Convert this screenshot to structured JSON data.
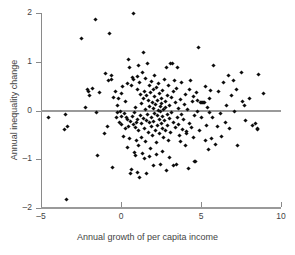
{
  "chart_data": {
    "type": "scatter",
    "title": "",
    "xlabel": "Annual growth of per capita income",
    "ylabel": "Annual inequality change",
    "xlim": [
      -5,
      10
    ],
    "ylim": [
      -2,
      2
    ],
    "xticks": [
      -5,
      0,
      5,
      10
    ],
    "yticks": [
      -2,
      -1,
      0,
      1,
      2
    ],
    "xtick_labels": [
      "-5",
      "0",
      "5",
      "10"
    ],
    "ytick_labels": [
      "-2",
      "-1",
      "0",
      "1",
      "2"
    ],
    "grid": false,
    "legend": null,
    "reference_line": {
      "axis": "horizontal",
      "value": 0,
      "color": "#9a9a9a"
    },
    "marker": {
      "shape": "diamond",
      "size_px": 3,
      "color": "#0d0d0d"
    },
    "n_points": 232,
    "points": [
      [
        -4.55,
        -0.14
      ],
      [
        -3.45,
        -0.09
      ],
      [
        -3.52,
        -0.39
      ],
      [
        -3.35,
        -0.32
      ],
      [
        -3.4,
        -1.83
      ],
      [
        -2.45,
        1.47
      ],
      [
        -2.25,
        0.07
      ],
      [
        -2.1,
        0.44
      ],
      [
        -2.05,
        0.38
      ],
      [
        -1.95,
        0.3
      ],
      [
        -1.8,
        0.46
      ],
      [
        -1.62,
        1.86
      ],
      [
        -1.55,
        -0.05
      ],
      [
        -1.45,
        -0.92
      ],
      [
        -1.35,
        0.37
      ],
      [
        -1.05,
        -0.47
      ],
      [
        -0.95,
        0.75
      ],
      [
        -0.85,
        -0.32
      ],
      [
        -0.8,
        0.62
      ],
      [
        -0.7,
        1.57
      ],
      [
        -0.62,
        0.64
      ],
      [
        -0.58,
        0.71
      ],
      [
        -0.55,
        -1.16
      ],
      [
        -0.45,
        0.27
      ],
      [
        -0.35,
        0.39
      ],
      [
        -0.3,
        -0.14
      ],
      [
        -0.25,
        0.11
      ],
      [
        -0.2,
        -0.05
      ],
      [
        -0.15,
        0.25
      ],
      [
        -0.1,
        -0.24
      ],
      [
        -0.05,
        -0.02
      ],
      [
        0.0,
        -0.12
      ],
      [
        0.02,
        0.35
      ],
      [
        0.05,
        -0.29
      ],
      [
        0.1,
        0.5
      ],
      [
        0.15,
        -0.53
      ],
      [
        0.2,
        -0.06
      ],
      [
        0.25,
        -0.36
      ],
      [
        0.3,
        0.18
      ],
      [
        0.35,
        -0.14
      ],
      [
        0.4,
        0.56
      ],
      [
        0.42,
        -0.18
      ],
      [
        0.45,
        1.04
      ],
      [
        0.48,
        -0.32
      ],
      [
        0.5,
        -0.58
      ],
      [
        0.55,
        0.88
      ],
      [
        0.58,
        -0.22
      ],
      [
        0.6,
        -1.3
      ],
      [
        0.65,
        0.52
      ],
      [
        0.7,
        -0.12
      ],
      [
        0.72,
        0.68
      ],
      [
        0.75,
        0.64
      ],
      [
        0.78,
        -0.28
      ],
      [
        0.8,
        1.98
      ],
      [
        0.82,
        -0.04
      ],
      [
        0.85,
        -0.86
      ],
      [
        0.88,
        -0.92
      ],
      [
        0.9,
        -0.34
      ],
      [
        0.92,
        0.06
      ],
      [
        0.95,
        -0.62
      ],
      [
        0.98,
        -0.25
      ],
      [
        1.0,
        0.7
      ],
      [
        1.02,
        -0.18
      ],
      [
        1.05,
        0.44
      ],
      [
        1.08,
        -0.72
      ],
      [
        1.1,
        0.92
      ],
      [
        1.12,
        -0.42
      ],
      [
        1.15,
        -1.37
      ],
      [
        1.18,
        0.58
      ],
      [
        1.2,
        -0.1
      ],
      [
        1.22,
        0.32
      ],
      [
        1.25,
        -0.55
      ],
      [
        1.28,
        0.14
      ],
      [
        1.3,
        -0.26
      ],
      [
        1.32,
        0.78
      ],
      [
        1.35,
        -0.88
      ],
      [
        1.38,
        0.24
      ],
      [
        1.4,
        1.2
      ],
      [
        1.42,
        -0.16
      ],
      [
        1.45,
        0.4
      ],
      [
        1.48,
        -0.36
      ],
      [
        1.5,
        0.02
      ],
      [
        1.52,
        -0.64
      ],
      [
        1.55,
        0.66
      ],
      [
        1.58,
        -0.2
      ],
      [
        1.6,
        0.3
      ],
      [
        1.62,
        -1.3
      ],
      [
        1.65,
        0.96
      ],
      [
        1.68,
        -0.08
      ],
      [
        1.7,
        0.2
      ],
      [
        1.72,
        -0.46
      ],
      [
        1.75,
        0.52
      ],
      [
        1.78,
        -0.24
      ],
      [
        1.8,
        0.08
      ],
      [
        1.82,
        -0.78
      ],
      [
        1.85,
        0.36
      ],
      [
        1.88,
        -0.14
      ],
      [
        1.9,
        0.6
      ],
      [
        1.92,
        -0.32
      ],
      [
        1.95,
        0.16
      ],
      [
        1.98,
        -0.52
      ],
      [
        2.0,
        0.04
      ],
      [
        2.02,
        0.44
      ],
      [
        2.05,
        -0.22
      ],
      [
        2.08,
        0.72
      ],
      [
        2.1,
        -0.06
      ],
      [
        2.12,
        0.28
      ],
      [
        2.15,
        -0.4
      ],
      [
        2.18,
        0.12
      ],
      [
        2.2,
        -0.66
      ],
      [
        2.22,
        0.48
      ],
      [
        2.25,
        -0.1
      ],
      [
        2.28,
        0.2
      ],
      [
        2.3,
        -0.3
      ],
      [
        2.32,
        0.0
      ],
      [
        2.35,
        0.56
      ],
      [
        2.38,
        -0.18
      ],
      [
        2.4,
        0.34
      ],
      [
        2.42,
        -0.48
      ],
      [
        2.45,
        0.08
      ],
      [
        2.48,
        -0.02
      ],
      [
        2.5,
        0.24
      ],
      [
        2.52,
        -0.26
      ],
      [
        2.55,
        0.14
      ],
      [
        2.58,
        -0.36
      ],
      [
        2.6,
        0.42
      ],
      [
        2.62,
        -0.12
      ],
      [
        2.65,
        0.02
      ],
      [
        2.68,
        -0.56
      ],
      [
        2.7,
        0.64
      ],
      [
        2.72,
        -0.2
      ],
      [
        2.75,
        0.18
      ],
      [
        2.78,
        -0.42
      ],
      [
        2.8,
        0.06
      ],
      [
        2.82,
        -1.23
      ],
      [
        2.85,
        0.88
      ],
      [
        2.88,
        -0.3
      ],
      [
        2.9,
        0.3
      ],
      [
        2.92,
        -0.08
      ],
      [
        2.95,
        0.52
      ],
      [
        2.98,
        -0.62
      ],
      [
        3.0,
        0.1
      ],
      [
        3.05,
        -0.16
      ],
      [
        3.08,
        0.96
      ],
      [
        3.1,
        -0.46
      ],
      [
        3.15,
        0.26
      ],
      [
        3.18,
        -0.04
      ],
      [
        3.2,
        0.96
      ],
      [
        3.25,
        -1.12
      ],
      [
        3.28,
        0.38
      ],
      [
        3.3,
        -0.24
      ],
      [
        3.35,
        0.62
      ],
      [
        3.38,
        -0.34
      ],
      [
        3.4,
        0.16
      ],
      [
        3.45,
        -1.1
      ],
      [
        3.48,
        0.46
      ],
      [
        3.5,
        -0.14
      ],
      [
        3.55,
        0.89
      ],
      [
        3.58,
        -0.28
      ],
      [
        3.6,
        0.04
      ],
      [
        3.65,
        -0.52
      ],
      [
        3.7,
        0.22
      ],
      [
        3.75,
        -0.08
      ],
      [
        3.8,
        0.58
      ],
      [
        3.85,
        -0.38
      ],
      [
        3.9,
        -0.18
      ],
      [
        3.95,
        0.12
      ],
      [
        4.0,
        -0.72
      ],
      [
        4.05,
        0.32
      ],
      [
        4.1,
        -0.44
      ],
      [
        4.15,
        0.02
      ],
      [
        4.2,
        -1.18
      ],
      [
        4.25,
        0.44
      ],
      [
        4.3,
        -0.26
      ],
      [
        4.35,
        0.62
      ],
      [
        4.4,
        -0.34
      ],
      [
        4.45,
        0.18
      ],
      [
        4.5,
        -0.56
      ],
      [
        4.55,
        0.28
      ],
      [
        4.6,
        -0.1
      ],
      [
        4.62,
        -1.04
      ],
      [
        4.65,
        -1.05
      ],
      [
        4.7,
        0.36
      ],
      [
        4.75,
        -0.02
      ],
      [
        4.8,
        0.2
      ],
      [
        4.85,
        1.29
      ],
      [
        4.9,
        -0.4
      ],
      [
        4.95,
        0.16
      ],
      [
        5.0,
        -0.14
      ],
      [
        5.05,
        0.17
      ],
      [
        5.1,
        0.17
      ],
      [
        5.15,
        0.16
      ],
      [
        5.2,
        0.16
      ],
      [
        5.25,
        -0.62
      ],
      [
        5.3,
        0.5
      ],
      [
        5.35,
        -0.3
      ],
      [
        5.4,
        0.06
      ],
      [
        5.45,
        -0.8
      ],
      [
        5.5,
        0.24
      ],
      [
        5.55,
        -0.05
      ],
      [
        5.6,
        0.42
      ],
      [
        5.65,
        -0.58
      ],
      [
        5.7,
        -0.15
      ],
      [
        5.8,
        0.92
      ],
      [
        5.9,
        -0.7
      ],
      [
        6.0,
        -0.32
      ],
      [
        6.1,
        0.38
      ],
      [
        6.2,
        -0.06
      ],
      [
        6.3,
        -0.54
      ],
      [
        6.4,
        0.58
      ],
      [
        6.5,
        -0.24
      ],
      [
        6.6,
        0.1
      ],
      [
        6.7,
        0.72
      ],
      [
        6.8,
        -0.36
      ],
      [
        6.9,
        0.3
      ],
      [
        7.0,
        0.62
      ],
      [
        7.1,
        -0.02
      ],
      [
        7.2,
        0.44
      ],
      [
        7.3,
        -0.71
      ],
      [
        7.5,
        0.78
      ],
      [
        7.6,
        0.18
      ],
      [
        7.7,
        0.11
      ],
      [
        7.8,
        -0.2
      ],
      [
        8.0,
        0.24
      ],
      [
        8.2,
        -0.3
      ],
      [
        8.4,
        -0.26
      ],
      [
        8.5,
        -0.36
      ],
      [
        8.55,
        -0.38
      ],
      [
        8.6,
        0.74
      ],
      [
        8.9,
        0.34
      ],
      [
        0.65,
        -1.22
      ],
      [
        1.05,
        -1.28
      ],
      [
        2.05,
        -1.13
      ],
      [
        2.48,
        -1.11
      ],
      [
        3.02,
        -0.96
      ],
      [
        1.48,
        -0.98
      ],
      [
        1.78,
        -0.94
      ],
      [
        2.22,
        -0.9
      ],
      [
        2.62,
        -0.84
      ],
      [
        0.42,
        -0.76
      ],
      [
        3.72,
        -0.64
      ],
      [
        4.12,
        -0.48
      ]
    ]
  },
  "axes": {
    "x_title": "Annual growth of per capita income",
    "y_title": "Annual inequality change"
  }
}
